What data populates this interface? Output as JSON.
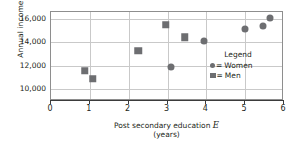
{
  "chart_data": {
    "type": "scatter",
    "title": "",
    "xlabel": "Post secondary education E",
    "xlabel_line2": "(years)",
    "xlabel_symbol": "E",
    "xlabel_prefix": "Post secondary education ",
    "ylabel_prefix": "Annual income ",
    "ylabel_symbol": "Y",
    "ylabel": "Annual income Y",
    "xlim": [
      0,
      6
    ],
    "ylim": [
      9000,
      16600
    ],
    "grid": true,
    "legend_position": "lower-right-inside",
    "xticks": [
      {
        "value": 0,
        "label": "0"
      },
      {
        "value": 1,
        "label": "1"
      },
      {
        "value": 2,
        "label": "2"
      },
      {
        "value": 3,
        "label": "3"
      },
      {
        "value": 4,
        "label": "4"
      },
      {
        "value": 5,
        "label": "5"
      },
      {
        "value": 6,
        "label": "6"
      }
    ],
    "yticks": [
      {
        "value": 10000,
        "label": "10,000"
      },
      {
        "value": 12000,
        "label": "12,000"
      },
      {
        "value": 14000,
        "label": "14,000"
      },
      {
        "value": 16000,
        "label": "16,000"
      }
    ],
    "series": [
      {
        "name": "Women",
        "marker": "circle",
        "color": "#6d6e71",
        "points": [
          {
            "x": 3.08,
            "y": 11900
          },
          {
            "x": 3.95,
            "y": 14150
          },
          {
            "x": 5.0,
            "y": 15150
          },
          {
            "x": 5.45,
            "y": 15400
          },
          {
            "x": 5.63,
            "y": 16050
          }
        ]
      },
      {
        "name": "Men",
        "marker": "square",
        "color": "#6d6e71",
        "points": [
          {
            "x": 0.87,
            "y": 11600
          },
          {
            "x": 1.08,
            "y": 10900
          },
          {
            "x": 2.25,
            "y": 13300
          },
          {
            "x": 2.95,
            "y": 15500
          },
          {
            "x": 3.45,
            "y": 14450
          }
        ]
      }
    ]
  },
  "legend": {
    "title": "Legend",
    "equals": "=",
    "entries": [
      {
        "label": "Women",
        "marker": "circle"
      },
      {
        "label": "Men",
        "marker": "square"
      }
    ]
  }
}
